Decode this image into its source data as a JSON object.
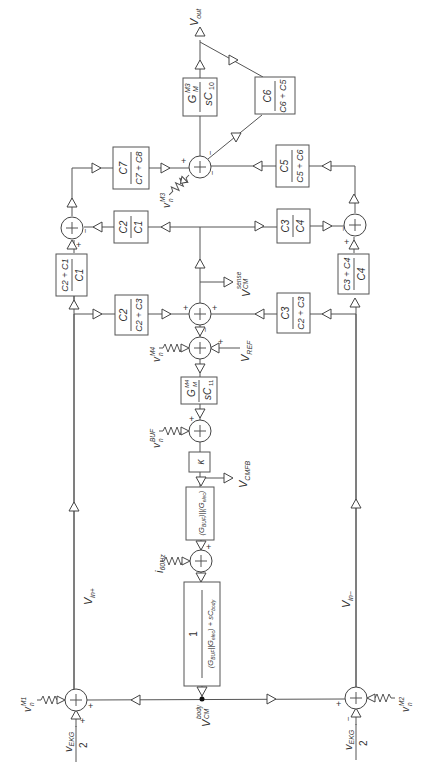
{
  "diagram": {
    "orientation": "rotated 90 degrees counter-clockwise",
    "signals": {
      "vout": "V",
      "vout_sub": "out",
      "vin_plus": "V",
      "vin_plus_sub": "in+",
      "vin_minus": "V",
      "vin_minus_sub": "in−",
      "vcm_sense": "V",
      "vcm_sense_sub": "CM",
      "vcm_sense_sup": "sense",
      "vref": "V",
      "vref_sub": "REF",
      "vcmfb": "V",
      "vcmfb_sub": "CMFB",
      "vcm_body": "V",
      "vcm_body_sub": "CM",
      "vcm_body_sup": "body",
      "vekg_num": "v",
      "vekg_sub": "EKG",
      "vekg_den": "2",
      "i60": "i",
      "i60_sub": "60Hz"
    },
    "noise_sources": {
      "m1": {
        "base": "v",
        "sub": "n",
        "sup": "M1"
      },
      "m2": {
        "base": "v",
        "sub": "n",
        "sup": "M2"
      },
      "m3": {
        "base": "v",
        "sub": "n",
        "sup": "M3"
      },
      "m4": {
        "base": "v",
        "sub": "n",
        "sup": "M4"
      },
      "buf": {
        "base": "v",
        "sub": "n",
        "sup": "BUF"
      }
    },
    "blocks": {
      "gm3": {
        "num": "G",
        "num_sub": "M",
        "num_sup": "M3",
        "den": "sC",
        "den_sub": "10"
      },
      "c6": {
        "num": "C6",
        "den": "C6 + C5"
      },
      "c7": {
        "num": "C7",
        "den": "C7 + C8"
      },
      "c5": {
        "num": "C5",
        "den": "C5 + C6"
      },
      "c2c1": {
        "num": "C2",
        "den": "C1"
      },
      "c3c4": {
        "num": "C3",
        "den": "C4"
      },
      "c2pc1": {
        "num": "C2 + C1",
        "den": "C1"
      },
      "c3pc4": {
        "num": "C3 + C4",
        "den": "C4"
      },
      "c2c23": {
        "num": "C2",
        "den": "C2 + C3"
      },
      "c3c23": {
        "num": "C3",
        "den": "C2 + C3"
      },
      "gm4": {
        "num": "G",
        "num_sub": "M",
        "num_sup": "M4",
        "den": "sC",
        "den_sub": "11"
      },
      "kappa": {
        "label": "κ"
      },
      "gbuf": {
        "label": "(G",
        "a": "BUF",
        "b": ")||(G",
        "c": "elec",
        "d": ")"
      },
      "body": {
        "num": "1",
        "den": "(G_BUF||G_elec) + sC_body"
      }
    },
    "signs": {
      "plus": "+",
      "minus": "−"
    }
  }
}
